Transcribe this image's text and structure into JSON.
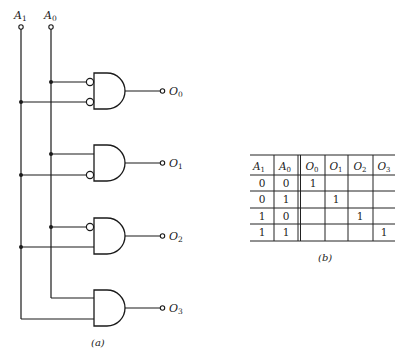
{
  "figure": {
    "circuit": {
      "caption": "(a)",
      "inputs": [
        {
          "name": "A",
          "sub": "1",
          "x": 21
        },
        {
          "name": "A",
          "sub": "0",
          "x": 51
        }
      ],
      "outputs": [
        {
          "name": "O",
          "sub": "0",
          "y": 91,
          "inverted_inputs": [
            "A0",
            "A1"
          ]
        },
        {
          "name": "O",
          "sub": "1",
          "y": 163,
          "inverted_inputs": [
            "A1"
          ]
        },
        {
          "name": "O",
          "sub": "2",
          "y": 236,
          "inverted_inputs": [
            "A0"
          ]
        },
        {
          "name": "O",
          "sub": "3",
          "y": 308,
          "inverted_inputs": []
        }
      ],
      "gate_type": "AND",
      "colors": {
        "line": "#1a1a1a",
        "background": "#ffffff"
      }
    },
    "truth_table": {
      "caption": "(b)",
      "headers": [
        {
          "name": "A",
          "sub": "1"
        },
        {
          "name": "A",
          "sub": "0"
        },
        {
          "name": "O",
          "sub": "0"
        },
        {
          "name": "O",
          "sub": "1"
        },
        {
          "name": "O",
          "sub": "2"
        },
        {
          "name": "O",
          "sub": "3"
        }
      ],
      "rows": [
        [
          "0",
          "0",
          "1",
          "",
          "",
          ""
        ],
        [
          "0",
          "1",
          "",
          "1",
          "",
          ""
        ],
        [
          "1",
          "0",
          "",
          "",
          "1",
          ""
        ],
        [
          "1",
          "1",
          "",
          "",
          "",
          "1"
        ]
      ]
    }
  }
}
